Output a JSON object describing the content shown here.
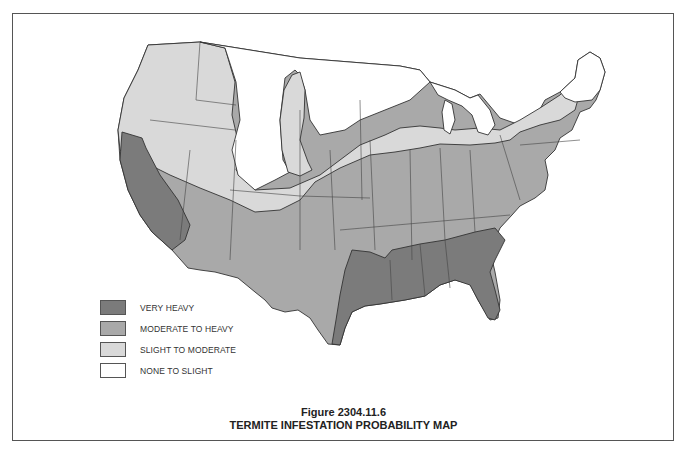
{
  "figure": {
    "number_label": "Figure 2304.11.6",
    "title": "TERMITE INFESTATION PROBABILITY MAP"
  },
  "legend": {
    "items": [
      {
        "label": "VERY HEAVY",
        "color": "#7b7b7b"
      },
      {
        "label": "MODERATE TO HEAVY",
        "color": "#a9a9a9"
      },
      {
        "label": "SLIGHT TO MODERATE",
        "color": "#d9d9d9"
      },
      {
        "label": "NONE TO SLIGHT",
        "color": "#ffffff"
      }
    ]
  },
  "map": {
    "subject": "Contiguous United States",
    "zones": {
      "very_heavy": [
        "California",
        "Texas (east)",
        "Louisiana",
        "Mississippi",
        "Alabama",
        "Georgia",
        "South Carolina",
        "Florida"
      ],
      "moderate_to_heavy": [
        "Oregon (south)",
        "Nevada",
        "Utah (south)",
        "Arizona",
        "New Mexico",
        "Texas (west)",
        "Oklahoma",
        "Kansas",
        "Nebraska (south)",
        "Missouri",
        "Arkansas",
        "Iowa",
        "Illinois",
        "Indiana",
        "Ohio",
        "Kentucky",
        "Tennessee",
        "West Virginia",
        "Virginia",
        "North Carolina",
        "Pennsylvania",
        "New Jersey",
        "Maryland",
        "Delaware",
        "New York (south)",
        "Connecticut",
        "Rhode Island",
        "Massachusetts"
      ],
      "slight_to_moderate": [
        "Washington",
        "Oregon (north)",
        "Idaho",
        "Utah (north)",
        "Colorado (band)",
        "Wyoming (band)",
        "Nebraska (north)",
        "South Dakota (band)",
        "Minnesota (south)",
        "Wisconsin",
        "Michigan",
        "New York (north)",
        "Vermont (south)",
        "New Hampshire (south)"
      ],
      "none_to_slight": [
        "Montana",
        "Wyoming",
        "North Dakota",
        "Minnesota (north)",
        "Colorado (west)",
        "Maine",
        "Vermont (north)",
        "New Hampshire (north)",
        "Michigan Upper Peninsula"
      ]
    }
  }
}
